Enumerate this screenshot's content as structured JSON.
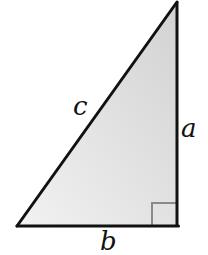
{
  "diagram": {
    "type": "right-triangle",
    "labels": {
      "hypotenuse": "c",
      "vertical_leg": "a",
      "horizontal_leg": "b"
    },
    "colors": {
      "stroke": "#111111",
      "fill_top": "#d6d6d6",
      "fill_bottom": "#f2f2f2",
      "right_angle_marker": "#8a8a8a"
    },
    "right_angle_marker": true
  }
}
